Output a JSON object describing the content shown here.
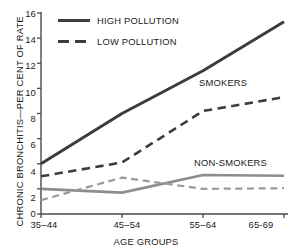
{
  "chart_data": {
    "type": "line",
    "title": "",
    "xlabel": "AGE GROUPS",
    "ylabel": "CHRONIC BRONCHITIS—PER CENT OF RATE",
    "categories": [
      "35–44",
      "45–54",
      "55–64",
      "65-69"
    ],
    "ylim": [
      0,
      16
    ],
    "yticks": [
      0,
      2,
      4,
      6,
      8,
      10,
      12,
      14,
      16
    ],
    "grid": false,
    "legend": {
      "position": "top-left",
      "entries": [
        {
          "label": "HIGH POLLUTION",
          "style": "solid"
        },
        {
          "label": "LOW POLLUTION",
          "style": "dashed"
        }
      ]
    },
    "annotations": [
      {
        "text": "SMOKERS",
        "x_category": "55–64",
        "value": 10.2
      },
      {
        "text": "NON-SMOKERS",
        "x_category": "55–64",
        "value": 3.9
      }
    ],
    "series": [
      {
        "name": "SMOKERS — HIGH POLLUTION",
        "group": "SMOKERS",
        "pollution": "HIGH POLLUTION",
        "style": "solid",
        "color": "#3c3c3c",
        "width": 3.0,
        "values": [
          4.0,
          8.0,
          11.4,
          15.3
        ]
      },
      {
        "name": "SMOKERS — LOW POLLUTION",
        "group": "SMOKERS",
        "pollution": "LOW POLLUTION",
        "style": "dashed",
        "color": "#3c3c3c",
        "width": 2.6,
        "values": [
          3.0,
          4.1,
          8.2,
          9.3
        ]
      },
      {
        "name": "NON-SMOKERS — HIGH POLLUTION",
        "group": "NON-SMOKERS",
        "pollution": "HIGH POLLUTION",
        "style": "solid",
        "color": "#8d8d8d",
        "width": 2.6,
        "values": [
          2.0,
          1.7,
          3.1,
          3.05
        ]
      },
      {
        "name": "NON-SMOKERS — LOW POLLUTION",
        "group": "NON-SMOKERS",
        "pollution": "LOW POLLUTION",
        "style": "dashed",
        "color": "#9a9a9a",
        "width": 2.2,
        "values": [
          1.1,
          2.9,
          2.0,
          2.05
        ]
      }
    ]
  },
  "axes": {
    "y_title": "CHRONIC BRONCHITIS—PER CENT OF RATE",
    "x_title": "AGE GROUPS",
    "y_tick_labels": [
      "16",
      "14",
      "12",
      "10",
      "8",
      "6",
      "4",
      "2",
      "0"
    ],
    "x_tick_labels": [
      "35–44",
      "45–54",
      "55–64",
      "65-69"
    ],
    "axis_color": "#4a4a4a"
  },
  "legend": {
    "items": [
      {
        "label": "HIGH POLLUTION",
        "style": "solid"
      },
      {
        "label": "LOW POLLUTION",
        "style": "dashed"
      }
    ]
  },
  "annotations": {
    "smokers": "SMOKERS",
    "non_smokers": "NON-SMOKERS"
  },
  "colors": {
    "smokers": "#3c3c3c",
    "non_smokers": "#8d8d8d",
    "axis": "#4a4a4a",
    "text": "#1a1a1a",
    "background": "#ffffff"
  }
}
